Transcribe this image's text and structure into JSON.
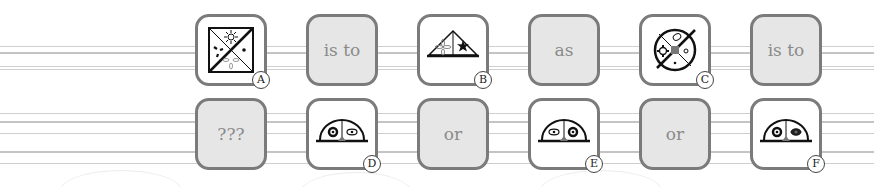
{
  "puzzle": {
    "row1": [
      {
        "type": "image",
        "label": "A",
        "icon": "square-quadrants-sun-spinner-dot-icon"
      },
      {
        "type": "word",
        "text": "is to"
      },
      {
        "type": "image",
        "label": "B",
        "icon": "triangle-split-fan-star-icon"
      },
      {
        "type": "word",
        "text": "as"
      },
      {
        "type": "image",
        "label": "C",
        "icon": "circle-quadrants-gear-leaf-dot-icon"
      },
      {
        "type": "word",
        "text": "is to"
      }
    ],
    "row2": [
      {
        "type": "word",
        "text": "???"
      },
      {
        "type": "image",
        "label": "D",
        "icon": "dome-gear-eye-icon"
      },
      {
        "type": "word",
        "text": "or"
      },
      {
        "type": "image",
        "label": "E",
        "icon": "dome-eye-gear-icon"
      },
      {
        "type": "word",
        "text": "or"
      },
      {
        "type": "image",
        "label": "F",
        "icon": "dome-gear-dark-eye-icon"
      }
    ]
  },
  "colors": {
    "tile_border": "#7b7b7b",
    "word_tile_bg": "#e6e6e6",
    "word_text": "#8a8a8a",
    "line": "#cfcfcf"
  }
}
